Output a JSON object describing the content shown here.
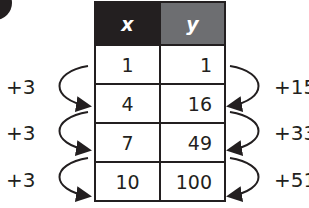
{
  "table": {
    "headers": [
      "x",
      "y"
    ],
    "rows": [
      {
        "x": "1",
        "y": "1"
      },
      {
        "x": "4",
        "y": "16"
      },
      {
        "x": "7",
        "y": "49"
      },
      {
        "x": "10",
        "y": "100"
      }
    ]
  },
  "left_differences": [
    "+3",
    "+3",
    "+3"
  ],
  "right_differences": [
    "+15",
    "+33",
    "+51"
  ],
  "colors": {
    "x_header": "#231f20",
    "y_header": "#6d6e71",
    "ink": "#231f20"
  }
}
